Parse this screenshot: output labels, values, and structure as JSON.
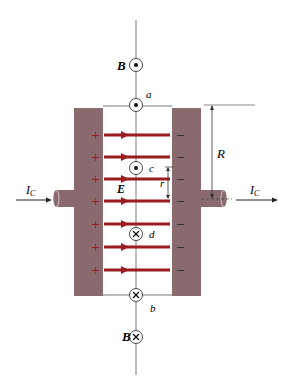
{
  "figure": {
    "colors": {
      "plate": "#8a6a6e",
      "field": "#9b1c1f",
      "line": "#333333"
    }
  },
  "labels": {
    "B_top": "B",
    "B_bottom": "B",
    "point_a": "a",
    "point_b": "b",
    "point_c": "c",
    "point_d": "d",
    "E": "E",
    "R": "R",
    "r": "r",
    "Ic_left": "I",
    "Ic_left_sub": "C",
    "Ic_right": "I",
    "Ic_right_sub": "C",
    "plus": "+",
    "minus": "−"
  },
  "field_lines": [
    {
      "y": 135
    },
    {
      "y": 157
    },
    {
      "y": 179
    },
    {
      "y": 201
    },
    {
      "y": 224
    },
    {
      "y": 247
    },
    {
      "y": 270
    }
  ],
  "symbols": [
    {
      "id": "B_top",
      "type": "out-of-page",
      "y": 65
    },
    {
      "id": "a",
      "type": "out-of-page",
      "y": 105
    },
    {
      "id": "c",
      "type": "out-of-page",
      "y": 168
    },
    {
      "id": "d",
      "type": "into-page",
      "y": 234
    },
    {
      "id": "b",
      "type": "into-page",
      "y": 295
    },
    {
      "id": "B_bottom",
      "type": "into-page",
      "y": 337
    }
  ]
}
